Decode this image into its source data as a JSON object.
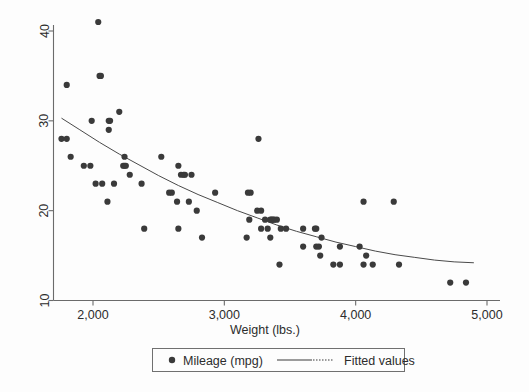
{
  "chart_data": {
    "type": "scatter",
    "title": "",
    "xlabel": "Weight (lbs.)",
    "ylabel": "",
    "xlim": [
      1690,
      5060
    ],
    "ylim": [
      9.0,
      42.2
    ],
    "grid": false,
    "xticks": [
      2000,
      3000,
      4000,
      5000
    ],
    "xtick_labels": [
      "2,000",
      "3,000",
      "4,000",
      "5,000"
    ],
    "yticks": [
      10,
      20,
      30,
      40
    ],
    "ytick_labels": [
      "10",
      "20",
      "30",
      "40"
    ],
    "legend_position": "bottom",
    "series": [
      {
        "name": "Mileage (mpg)",
        "type": "scatter",
        "marker": "circle",
        "color": "#3a3a3a",
        "points": [
          [
            1760,
            28
          ],
          [
            1800,
            28
          ],
          [
            1800,
            34
          ],
          [
            1830,
            26
          ],
          [
            1930,
            25
          ],
          [
            1980,
            25
          ],
          [
            1990,
            30
          ],
          [
            2020,
            23
          ],
          [
            2040,
            41
          ],
          [
            2050,
            35
          ],
          [
            2060,
            35
          ],
          [
            2070,
            23
          ],
          [
            2110,
            21
          ],
          [
            2120,
            30
          ],
          [
            2120,
            29
          ],
          [
            2130,
            30
          ],
          [
            2160,
            23
          ],
          [
            2200,
            31
          ],
          [
            2230,
            25
          ],
          [
            2240,
            25
          ],
          [
            2240,
            26
          ],
          [
            2250,
            25
          ],
          [
            2280,
            24
          ],
          [
            2370,
            23
          ],
          [
            2390,
            18
          ],
          [
            2520,
            26
          ],
          [
            2580,
            22
          ],
          [
            2600,
            22
          ],
          [
            2640,
            21
          ],
          [
            2650,
            18
          ],
          [
            2650,
            25
          ],
          [
            2670,
            24
          ],
          [
            2690,
            24
          ],
          [
            2700,
            24
          ],
          [
            2730,
            21
          ],
          [
            2750,
            24
          ],
          [
            2790,
            20
          ],
          [
            2830,
            17
          ],
          [
            2930,
            22
          ],
          [
            3170,
            17
          ],
          [
            3180,
            22
          ],
          [
            3190,
            19
          ],
          [
            3200,
            22
          ],
          [
            3250,
            20
          ],
          [
            3260,
            28
          ],
          [
            3280,
            20
          ],
          [
            3280,
            18
          ],
          [
            3310,
            19
          ],
          [
            3330,
            18
          ],
          [
            3350,
            19
          ],
          [
            3350,
            17
          ],
          [
            3360,
            19
          ],
          [
            3370,
            19
          ],
          [
            3380,
            19
          ],
          [
            3400,
            19
          ],
          [
            3420,
            14
          ],
          [
            3430,
            18
          ],
          [
            3470,
            18
          ],
          [
            3600,
            18
          ],
          [
            3600,
            16
          ],
          [
            3690,
            18
          ],
          [
            3700,
            18
          ],
          [
            3700,
            16
          ],
          [
            3720,
            16
          ],
          [
            3730,
            15
          ],
          [
            3740,
            17
          ],
          [
            3830,
            14
          ],
          [
            3880,
            14
          ],
          [
            3880,
            16
          ],
          [
            4030,
            16
          ],
          [
            4060,
            21
          ],
          [
            4060,
            14
          ],
          [
            4080,
            15
          ],
          [
            4130,
            14
          ],
          [
            4290,
            21
          ],
          [
            4330,
            14
          ],
          [
            4720,
            12
          ],
          [
            4840,
            12
          ]
        ]
      },
      {
        "name": "Fitted values",
        "type": "line",
        "color": "#4a4a4a",
        "points": [
          [
            1760,
            30.3
          ],
          [
            1900,
            29.0
          ],
          [
            2050,
            27.6
          ],
          [
            2200,
            26.3
          ],
          [
            2350,
            25.1
          ],
          [
            2500,
            23.9
          ],
          [
            2650,
            22.8
          ],
          [
            2800,
            21.8
          ],
          [
            2950,
            20.9
          ],
          [
            3100,
            20.0
          ],
          [
            3250,
            19.2
          ],
          [
            3400,
            18.4
          ],
          [
            3550,
            17.7
          ],
          [
            3700,
            17.1
          ],
          [
            3850,
            16.5
          ],
          [
            4000,
            16.0
          ],
          [
            4150,
            15.5
          ],
          [
            4300,
            15.1
          ],
          [
            4450,
            14.8
          ],
          [
            4600,
            14.5
          ],
          [
            4750,
            14.3
          ],
          [
            4900,
            14.2
          ]
        ]
      }
    ]
  },
  "legend": {
    "items": [
      {
        "label": "Mileage (mpg)",
        "marker": "circle-marker-icon"
      },
      {
        "label": "Fitted values",
        "marker": "line-marker-icon"
      }
    ]
  }
}
